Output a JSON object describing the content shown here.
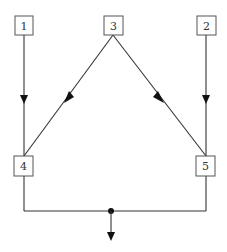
{
  "diagram": {
    "type": "flow",
    "nodes": [
      {
        "id": "1",
        "label": "1",
        "x": 15,
        "y": 16,
        "w": 18,
        "h": 19
      },
      {
        "id": "3",
        "label": "3",
        "x": 104,
        "y": 16,
        "w": 19,
        "h": 19
      },
      {
        "id": "2",
        "label": "2",
        "x": 197,
        "y": 16,
        "w": 19,
        "h": 19
      },
      {
        "id": "4",
        "label": "4",
        "x": 14,
        "y": 156,
        "w": 19,
        "h": 20
      },
      {
        "id": "5",
        "label": "5",
        "x": 196,
        "y": 156,
        "w": 19,
        "h": 20
      }
    ],
    "edges": [
      {
        "from": "1",
        "to": "4",
        "arrow": "mid"
      },
      {
        "from": "3",
        "to": "4",
        "arrow": "mid"
      },
      {
        "from": "3",
        "to": "5",
        "arrow": "mid"
      },
      {
        "from": "2",
        "to": "5",
        "arrow": "mid"
      },
      {
        "from": "4",
        "to": "junction",
        "arrow": "none"
      },
      {
        "from": "5",
        "to": "junction",
        "arrow": "none"
      },
      {
        "from": "junction",
        "to": "output",
        "arrow": "end"
      }
    ],
    "junction": {
      "x": 111,
      "y": 211
    },
    "colors": {
      "line": "#333333",
      "box_border": "#555555",
      "arrow": "#111111",
      "text": "#333333"
    }
  }
}
